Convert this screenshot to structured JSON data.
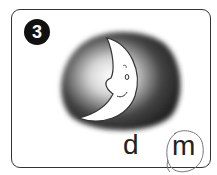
{
  "card": {
    "number": "3",
    "image": "moon-icon",
    "options": [
      {
        "label": "d",
        "selected": false
      },
      {
        "label": "m",
        "selected": true
      }
    ]
  }
}
